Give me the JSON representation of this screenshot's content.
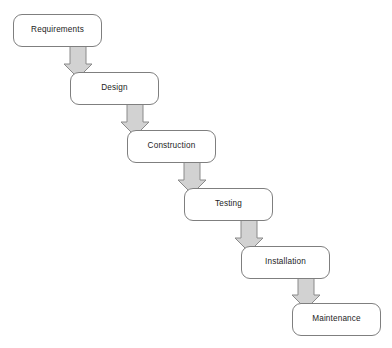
{
  "diagram": {
    "type": "waterfall-model-flowchart",
    "title": "",
    "orientation": "cascading-down-right",
    "colors": {
      "background": "#ffffff",
      "box_fill": "#ffffff",
      "box_border": "#7f7f7f",
      "box_text": "#1c1c1c",
      "arrow_fill": "#d2d2d2",
      "arrow_border": "#8a8a8a"
    },
    "stages": [
      {
        "id": "requirements",
        "label": "Requirements",
        "x": 13,
        "y": 14,
        "order": 1
      },
      {
        "id": "design",
        "label": "Design",
        "x": 70,
        "y": 72,
        "order": 2
      },
      {
        "id": "construction",
        "label": "Construction",
        "x": 127,
        "y": 130,
        "order": 3
      },
      {
        "id": "testing",
        "label": "Testing",
        "x": 184,
        "y": 188,
        "order": 4
      },
      {
        "id": "installation",
        "label": "Installation",
        "x": 241,
        "y": 246,
        "order": 5
      },
      {
        "id": "maintenance",
        "label": "Maintenance",
        "x": 292,
        "y": 303,
        "order": 6
      }
    ],
    "arrows": [
      {
        "id": "arrow-requirements-to-design",
        "from": "requirements",
        "to": "design",
        "cx": 78,
        "top": 41,
        "bottom": 78
      },
      {
        "id": "arrow-design-to-construction",
        "from": "design",
        "to": "construction",
        "cx": 135,
        "top": 99,
        "bottom": 136
      },
      {
        "id": "arrow-construction-to-testing",
        "from": "construction",
        "to": "testing",
        "cx": 192,
        "top": 157,
        "bottom": 194
      },
      {
        "id": "arrow-testing-to-installation",
        "from": "testing",
        "to": "installation",
        "cx": 249,
        "top": 215,
        "bottom": 252
      },
      {
        "id": "arrow-installation-to-maintenance",
        "from": "installation",
        "to": "maintenance",
        "cx": 306,
        "top": 272,
        "bottom": 309
      }
    ]
  }
}
